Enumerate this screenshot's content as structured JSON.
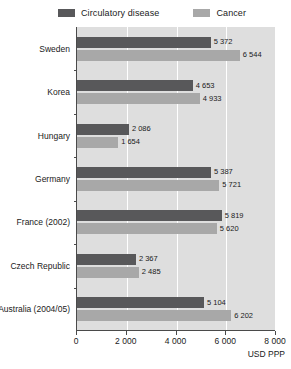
{
  "chart_data": {
    "type": "bar",
    "orientation": "horizontal",
    "title": "",
    "xlabel": "USD PPP",
    "ylabel": "",
    "xlim": [
      0,
      8000
    ],
    "xticks": [
      0,
      2000,
      4000,
      6000,
      8000
    ],
    "xtick_labels": [
      "0",
      "2 000",
      "4 000",
      "6 000",
      "8 000"
    ],
    "grid": true,
    "grid_axis": "x",
    "legend_position": "top",
    "categories": [
      "Sweden",
      "Korea",
      "Hungary",
      "Germany",
      "France (2002)",
      "Czech Republic",
      "Australia (2004/05)"
    ],
    "series": [
      {
        "name": "Circulatory disease",
        "color": "#58585a",
        "values": [
          5372,
          4653,
          2086,
          5387,
          5819,
          2367,
          5104
        ],
        "value_labels": [
          "5 372",
          "4 653",
          "2 086",
          "5 387",
          "5 819",
          "2 367",
          "5 104"
        ]
      },
      {
        "name": "Cancer",
        "color": "#a8a8a8",
        "values": [
          6544,
          4933,
          1654,
          5721,
          5620,
          2485,
          6202
        ],
        "value_labels": [
          "6 544",
          "4 933",
          "1 654",
          "5 721",
          "5 620",
          "2 485",
          "6 202"
        ]
      }
    ]
  },
  "legend": {
    "entries": [
      {
        "label": "Circulatory disease",
        "color": "#58585a"
      },
      {
        "label": "Cancer",
        "color": "#a8a8a8"
      }
    ]
  },
  "axis": {
    "unit_label": "USD PPP"
  },
  "style": {
    "plot_background": "#dedede",
    "gridline_color": "#ffffff",
    "axis_color": "#4a4a4a",
    "text_color": "#1a1a1a"
  }
}
